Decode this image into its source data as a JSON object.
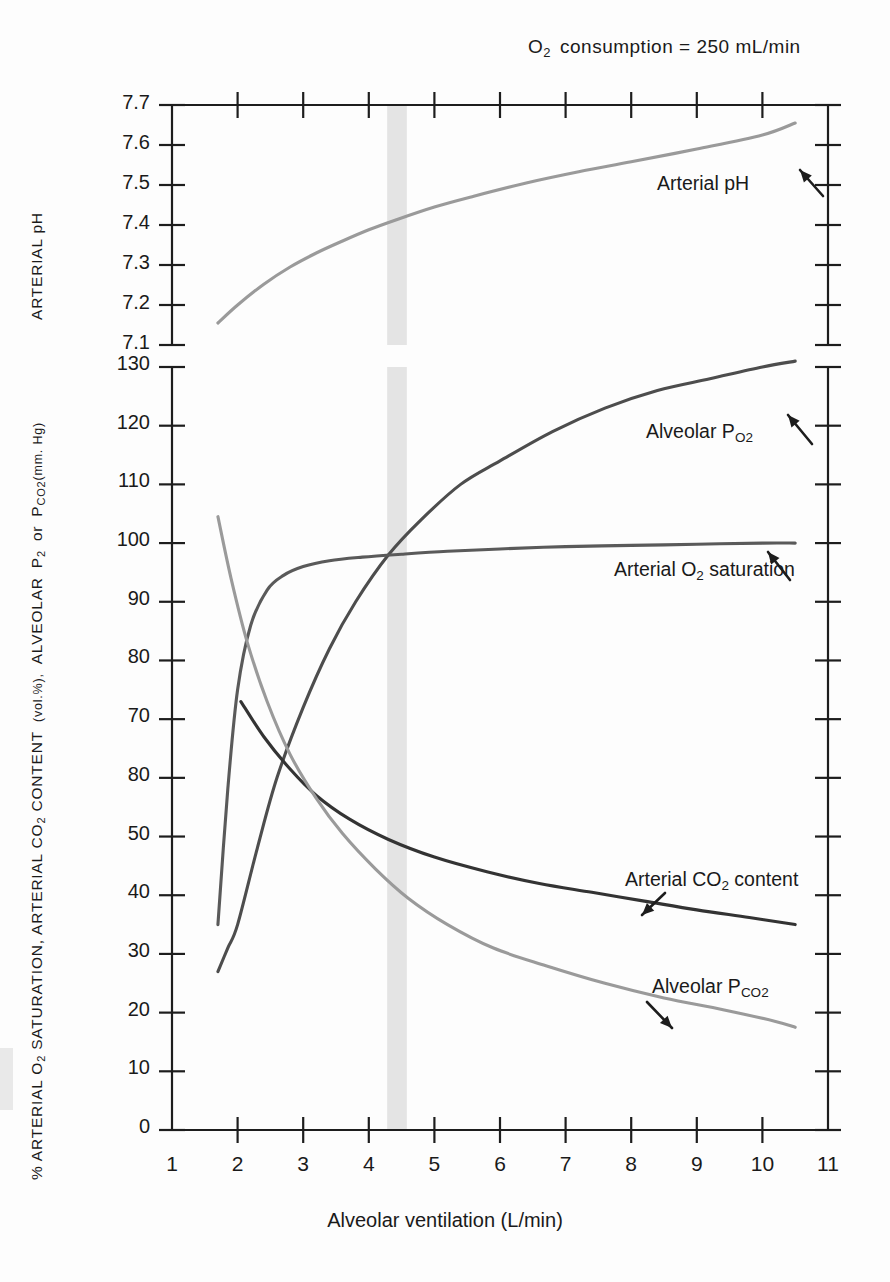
{
  "figure": {
    "title_prefix": "O",
    "title_sub": "2",
    "title_rest": "consumption  =  250  mL/min",
    "xlabel": "Alveolar ventilation (L/min)",
    "ylabel_main_a": "% ARTERIAL O",
    "ylabel_main_b": " SATURATION,  ARTERIAL  CO",
    "ylabel_main_c": " CONTENT",
    "ylabel_main_d": "(vol.%),",
    "ylabel_main_e": "ALVEOLAR",
    "ylabel_main_f": "P",
    "ylabel_main_g": "or",
    "ylabel_main_h": "P",
    "ylabel_main_i": "(mm. Hg)",
    "ylabel_ph": "ARTERIAL  pH",
    "sub_2": "2",
    "sub_o2": "O2",
    "sub_co2": "CO2"
  },
  "chart_data": {
    "type": "line",
    "xlabel": "Alveolar ventilation (L/min)",
    "ylabel": "% ARTERIAL O2 SATURATION, ARTERIAL CO2 CONTENT (vol.%), ALVEOLAR PO2 or PCO2 (mm. Hg)",
    "ylabel_top": "ARTERIAL pH",
    "grid": false,
    "legend": "inline-annotations",
    "xlim": [
      1,
      11
    ],
    "xticks": [
      1,
      2,
      3,
      4,
      5,
      6,
      7,
      8,
      9,
      10,
      11
    ],
    "panels": [
      {
        "name": "ph-panel",
        "ylim": [
          7.1,
          7.7
        ],
        "yticks": [
          "7.1",
          "7.2",
          "7.3",
          "7.4",
          "7.5",
          "7.6",
          "7.7"
        ],
        "series": [
          {
            "name": "Arterial pH",
            "color": "#9a9a9a",
            "label": "Arterial pH",
            "x": [
              1.7,
              2.0,
              2.4,
              2.8,
              3.2,
              3.6,
              4.0,
              4.4,
              5.0,
              5.6,
              6.4,
              7.2,
              8.0,
              9.0,
              10.0,
              10.5
            ],
            "y": [
              7.155,
              7.2,
              7.252,
              7.295,
              7.33,
              7.36,
              7.388,
              7.412,
              7.445,
              7.472,
              7.505,
              7.533,
              7.558,
              7.59,
              7.625,
              7.655
            ]
          }
        ]
      },
      {
        "name": "main-panel",
        "ylim": [
          0,
          130
        ],
        "yticks": [
          "0",
          "10",
          "20",
          "30",
          "40",
          "50",
          "80",
          "70",
          "80",
          "90",
          "100",
          "110",
          "120",
          "130"
        ],
        "ytick_values": [
          0,
          10,
          20,
          30,
          40,
          50,
          60,
          70,
          80,
          90,
          100,
          110,
          120,
          130
        ],
        "ytick_note": "label at the 60 position is printed as 80 in the original figure",
        "series": [
          {
            "name": "Alveolar PO2",
            "color": "#4d4d4d",
            "label": "Alveolar P",
            "label_sub": "O2",
            "x": [
              1.7,
              1.85,
              2.0,
              2.3,
              2.6,
              3.0,
              3.4,
              3.8,
              4.3,
              4.8,
              5.4,
              6.0,
              6.8,
              7.6,
              8.4,
              9.2,
              10.0,
              10.5
            ],
            "y": [
              27,
              31,
              35,
              48,
              60,
              72,
              82,
              90,
              98,
              104,
              110,
              114,
              119,
              123,
              126,
              128,
              130,
              131
            ]
          },
          {
            "name": "Arterial O2 saturation",
            "color": "#5a5a5a",
            "label": "Arterial O",
            "label_sub": "2",
            "label_rest": " saturation",
            "x": [
              1.7,
              1.85,
              2.0,
              2.2,
              2.45,
              2.7,
              3.0,
              3.4,
              3.9,
              4.5,
              5.2,
              6.0,
              7.0,
              8.0,
              9.0,
              10.0,
              10.5
            ],
            "y": [
              35,
              58,
              75,
              86,
              92,
              94.5,
              96,
              97,
              97.6,
              98.1,
              98.6,
              99.0,
              99.4,
              99.6,
              99.8,
              100,
              100
            ]
          },
          {
            "name": "Arterial CO2 content",
            "color": "#333333",
            "label": "Arterial CO",
            "label_sub": "2",
            "label_rest": " content",
            "x": [
              2.05,
              2.4,
              2.8,
              3.2,
              3.7,
              4.3,
              5.0,
              5.8,
              6.6,
              7.4,
              8.2,
              9.0,
              9.8,
              10.5
            ],
            "y": [
              73,
              67,
              61.5,
              57,
              53,
              49.5,
              46.5,
              44,
              42,
              40.5,
              39,
              37.5,
              36.2,
              35
            ]
          },
          {
            "name": "Alveolar PCO2",
            "color": "#9a9a9a",
            "label": "Alveolar P",
            "label_sub": "CO2",
            "x": [
              1.7,
              1.9,
              2.15,
              2.45,
              2.8,
              3.2,
              3.6,
              4.1,
              4.6,
              5.2,
              5.9,
              6.7,
              7.6,
              8.5,
              9.4,
              10.2,
              10.5
            ],
            "y": [
              104.5,
              94,
              83,
              73,
              64,
              56.5,
              50.5,
              44.5,
              39.5,
              35,
              31,
              28,
              25,
              22.5,
              20.5,
              18.5,
              17.5
            ]
          }
        ],
        "shaded_band": {
          "name": "normal-range-band",
          "x_from": 4.28,
          "x_to": 4.58,
          "color": "#e4e4e4"
        }
      }
    ]
  }
}
